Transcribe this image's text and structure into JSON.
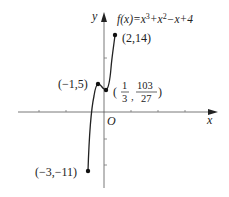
{
  "figure": {
    "function_label": {
      "prefix": "f(x)=x",
      "exp1": "3",
      "mid": "+x",
      "exp2": "2",
      "suffix": "−x+4"
    },
    "axes": {
      "x_label": "x",
      "y_label": "y",
      "origin_label": "O"
    },
    "points": [
      {
        "label": "(2,14)",
        "x": 2,
        "y": 14
      },
      {
        "label": "(−1,5)",
        "x": -1,
        "y": 5
      },
      {
        "label_open": "(",
        "num1": "1",
        "den1": "3",
        "sep": ",",
        "num2": "103",
        "den2": "27",
        "label_close": ")",
        "x": 0.3333,
        "y": 3.8148
      },
      {
        "label": "(−3,−11)",
        "x": -3,
        "y": -11
      }
    ],
    "colors": {
      "curve": "#222222",
      "axis": "#555555"
    }
  }
}
